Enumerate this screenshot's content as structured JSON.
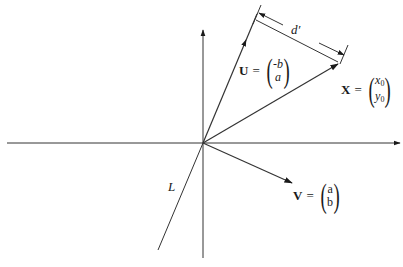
{
  "diagram": {
    "origin": {
      "x": 203,
      "y": 143
    },
    "axes": {
      "horizontal": {
        "x1": 7,
        "y1": 143,
        "x2": 400,
        "y2": 143,
        "arrow": "right"
      },
      "vertical": {
        "x1": 203,
        "y1": 258,
        "x2": 203,
        "y2": 30,
        "arrow": "up"
      }
    },
    "line_L": {
      "label": "L",
      "x1": 203,
      "y1": 143,
      "x2": 158,
      "y2": 250
    },
    "vectors": {
      "U": {
        "name": "U",
        "top": "-b",
        "bottom": "a",
        "tip": {
          "x": 257,
          "y": 14
        }
      },
      "X": {
        "name": "X",
        "top": "x",
        "top_sub": "0",
        "bottom": "y",
        "bottom_sub": "0",
        "tip": {
          "x": 338,
          "y": 64
        }
      },
      "V": {
        "name": "V",
        "top": "a",
        "bottom": "b",
        "tip": {
          "x": 292,
          "y": 183
        }
      }
    },
    "distance": {
      "label": "d′"
    },
    "equals": "="
  }
}
